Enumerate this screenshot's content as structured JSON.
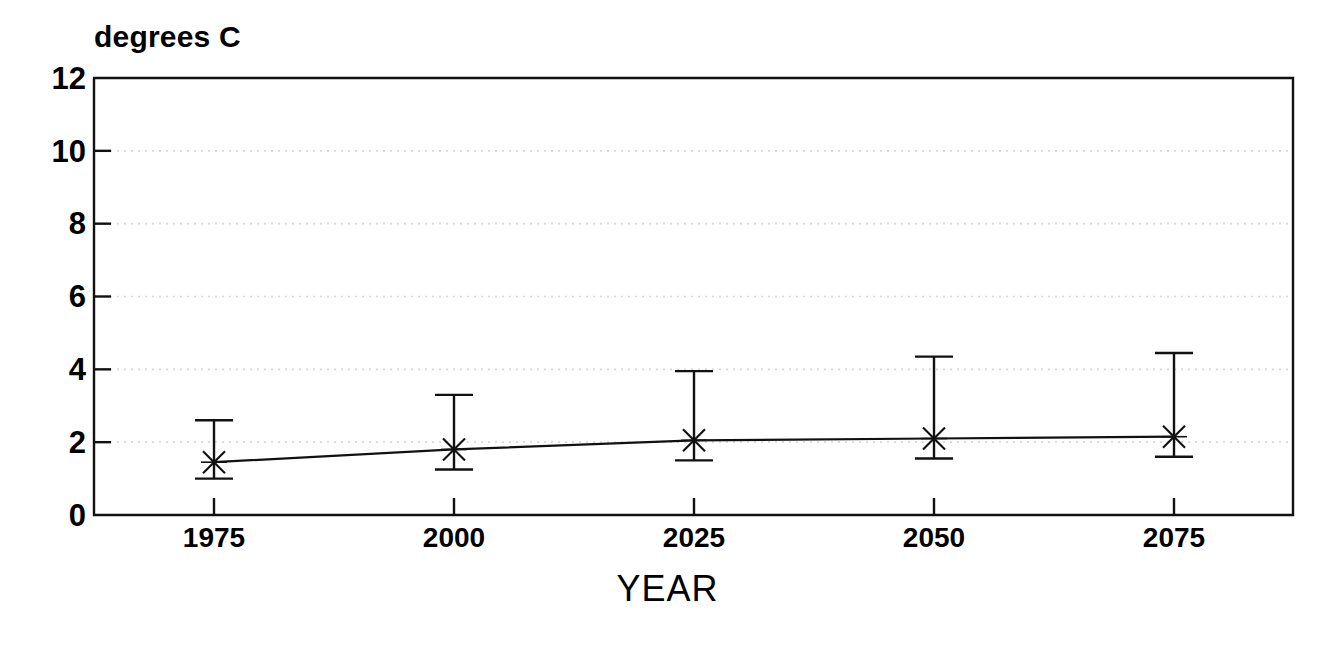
{
  "chart_data": {
    "type": "line",
    "title": "",
    "xlabel": "YEAR",
    "ylabel": "degrees C",
    "unit_label": "degrees C",
    "x": [
      1975,
      2000,
      2025,
      2050,
      2075
    ],
    "categories": [
      "1975",
      "2000",
      "2025",
      "2050",
      "2075"
    ],
    "values": [
      1.45,
      1.8,
      2.05,
      2.1,
      2.15
    ],
    "error_upper": [
      2.6,
      3.3,
      3.95,
      4.35,
      4.45
    ],
    "error_lower": [
      1.0,
      1.25,
      1.5,
      1.55,
      1.6
    ],
    "xlim": [
      1963,
      1988
    ],
    "ylim": [
      0,
      12
    ],
    "ytick_values": [
      0,
      2,
      4,
      6,
      8,
      10,
      12
    ],
    "ytick_labels": [
      "0",
      "2",
      "4",
      "6",
      "8",
      "10",
      "12"
    ],
    "xtick_labels": [
      "1975",
      "2000",
      "2025",
      "2050",
      "2075"
    ],
    "grid": "faint-horizontal",
    "legend": "none",
    "marker": "x-cross",
    "line_color": "#000000",
    "series": [
      {
        "name": "temperature anomaly",
        "values": [
          1.45,
          1.8,
          2.05,
          2.1,
          2.15
        ],
        "error_upper": [
          2.6,
          3.3,
          3.95,
          4.35,
          4.45
        ],
        "error_lower": [
          1.0,
          1.25,
          1.5,
          1.55,
          1.6
        ]
      }
    ]
  },
  "axes": {
    "y_unit": "degrees C",
    "x_title": "YEAR"
  }
}
